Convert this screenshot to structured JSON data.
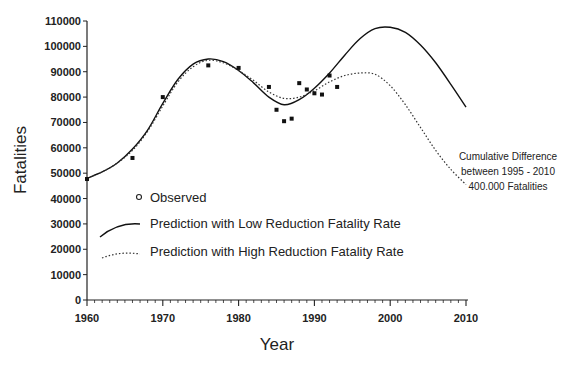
{
  "chart_data": {
    "type": "line",
    "title": "",
    "xlabel": "Year",
    "ylabel": "Fatalities",
    "xlim": [
      1960,
      2010
    ],
    "ylim": [
      0,
      110000
    ],
    "x_ticks": [
      1960,
      1970,
      1980,
      1990,
      2000,
      2010
    ],
    "x_tick_labels": [
      "1960",
      "1970",
      "1980",
      "1990",
      "2000",
      "2010"
    ],
    "y_ticks": [
      0,
      10000,
      20000,
      30000,
      40000,
      50000,
      60000,
      70000,
      80000,
      90000,
      100000,
      110000
    ],
    "y_tick_labels": [
      "0",
      "10000",
      "20000",
      "30000",
      "40000",
      "50000",
      "60000",
      "70000",
      "80000",
      "90000",
      "100000",
      "110000"
    ],
    "grid": false,
    "legend_position": "lower-left inside plot",
    "series": [
      {
        "name": "Observed",
        "style": "markers",
        "x": [
          1960,
          1966,
          1970,
          1976,
          1980,
          1984,
          1985,
          1986,
          1987,
          1988,
          1989,
          1990,
          1991,
          1992,
          1993
        ],
        "values": [
          47700,
          56000,
          80000,
          92500,
          91500,
          84000,
          75000,
          70500,
          71500,
          85500,
          83000,
          81500,
          81000,
          88500,
          84000
        ]
      },
      {
        "name": "Prediction with Low Reduction Fatality Rate",
        "style": "solid",
        "x": [
          1960,
          1962,
          1964,
          1966,
          1968,
          1970,
          1972,
          1974,
          1976,
          1978,
          1980,
          1982,
          1984,
          1986,
          1988,
          1990,
          1992,
          1994,
          1996,
          1998,
          2000,
          2002,
          2004,
          2006,
          2008,
          2010
        ],
        "values": [
          48000,
          50500,
          54000,
          59500,
          67000,
          77500,
          87000,
          93000,
          95000,
          94000,
          90500,
          85500,
          80000,
          77000,
          79000,
          83500,
          89500,
          96500,
          103000,
          107000,
          107500,
          105500,
          100500,
          93500,
          85000,
          76000
        ]
      },
      {
        "name": "Prediction with High Reduction Fatality Rate",
        "style": "dotted",
        "x": [
          1960,
          1962,
          1964,
          1966,
          1968,
          1970,
          1972,
          1974,
          1976,
          1978,
          1980,
          1982,
          1984,
          1986,
          1988,
          1990,
          1992,
          1994,
          1996,
          1998,
          2000,
          2002,
          2004,
          2006,
          2008,
          2010
        ],
        "values": [
          48000,
          50500,
          54000,
          59000,
          66500,
          76500,
          86000,
          92000,
          94500,
          93500,
          90500,
          86500,
          82000,
          79500,
          80000,
          82500,
          86000,
          88500,
          89500,
          89000,
          84500,
          77000,
          68000,
          59000,
          51500,
          45500
        ]
      }
    ],
    "annotations": [
      "Cumulative Difference",
      "between 1995 - 2010",
      "400.000 Fatalities"
    ]
  },
  "axes": {
    "xlabel": "Year",
    "ylabel": "Fatalities"
  },
  "legend": {
    "observed": "Observed",
    "low": "Prediction with Low Reduction Fatality Rate",
    "high": "Prediction with High Reduction Fatality Rate"
  },
  "annotation": {
    "line1": "Cumulative Difference",
    "line2": "between 1995 - 2010",
    "line3": "400.000 Fatalities"
  }
}
